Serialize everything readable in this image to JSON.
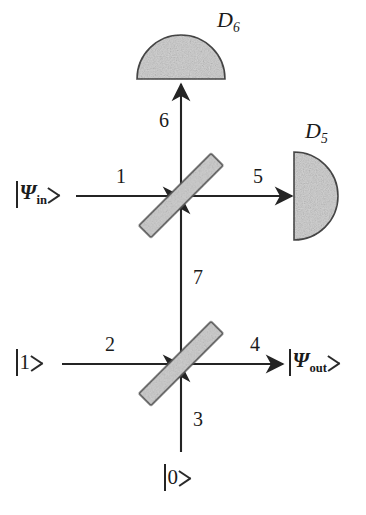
{
  "figure": {
    "kind": "optical-interferometer-diagram",
    "background_color": "#ffffff",
    "line_color": "#242424",
    "fill_color": "#d2d2d2",
    "fill_stroke_color": "#4a4a4a"
  },
  "detectors": [
    {
      "id": "D6",
      "label": "D",
      "subscript": "6",
      "shape": "half-disc-up",
      "name": "detector-d6"
    },
    {
      "id": "D5",
      "label": "D",
      "subscript": "5",
      "shape": "half-disc-right",
      "name": "detector-d5"
    }
  ],
  "beam_splitters": [
    {
      "id": "BS-upper",
      "label": "",
      "orientation_deg": -45
    },
    {
      "id": "BS-lower",
      "label": "",
      "orientation_deg": -45
    }
  ],
  "ports": [
    {
      "id": "1",
      "label": "1",
      "direction": "right",
      "role": "input-arm"
    },
    {
      "id": "2",
      "label": "2",
      "direction": "right",
      "role": "input-arm"
    },
    {
      "id": "3",
      "label": "3",
      "direction": "up",
      "role": "input-arm"
    },
    {
      "id": "4",
      "label": "4",
      "direction": "right",
      "role": "output-arm"
    },
    {
      "id": "5",
      "label": "5",
      "direction": "right",
      "role": "output-arm"
    },
    {
      "id": "6",
      "label": "6",
      "direction": "up",
      "role": "output-arm"
    },
    {
      "id": "7",
      "label": "7",
      "direction": "up",
      "role": "internal-arm"
    }
  ],
  "states": [
    {
      "id": "psi-in",
      "prefix": "",
      "symbol": "Ψ",
      "subscript": "in",
      "style": "psi",
      "role": "input"
    },
    {
      "id": "one",
      "prefix": "",
      "symbol": "1",
      "subscript": "",
      "style": "plain",
      "role": "input"
    },
    {
      "id": "zero",
      "prefix": "",
      "symbol": "0",
      "subscript": "",
      "style": "plain",
      "role": "input"
    },
    {
      "id": "psi-out",
      "prefix": "",
      "symbol": "Ψ",
      "subscript": "out",
      "style": "psi",
      "role": "output"
    }
  ]
}
